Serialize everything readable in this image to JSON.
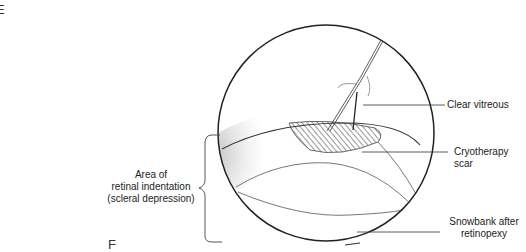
{
  "panel_labels": {
    "top": "E",
    "bottom": "F"
  },
  "labels": {
    "clear_vitreous": "Clear vitreous",
    "cryotherapy_scar": "Cryotherapy scar",
    "snowbank_line1": "Snowbank after",
    "snowbank_line2": "retinopexy",
    "indentation_line1": "Area of",
    "indentation_line2": "retinal indentation",
    "indentation_line3": "(scleral depression)"
  }
}
